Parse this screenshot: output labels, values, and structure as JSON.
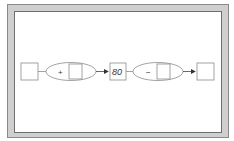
{
  "diagram": {
    "type": "number-machine-flow",
    "nodes": [
      {
        "id": "input-box",
        "kind": "box",
        "value": ""
      },
      {
        "id": "op1",
        "kind": "operator",
        "operator": "+",
        "operand": ""
      },
      {
        "id": "middle-box",
        "kind": "box",
        "value": "80"
      },
      {
        "id": "op2",
        "kind": "operator",
        "operator": "−",
        "operand": ""
      },
      {
        "id": "output-box",
        "kind": "box",
        "value": ""
      }
    ],
    "edges": [
      {
        "from": "input-box",
        "to": "op1",
        "arrow": false
      },
      {
        "from": "op1",
        "to": "middle-box",
        "arrow": true
      },
      {
        "from": "middle-box",
        "to": "op2",
        "arrow": false
      },
      {
        "from": "op2",
        "to": "output-box",
        "arrow": true
      }
    ]
  },
  "labels": {
    "op1_symbol": "+",
    "middle_value": "80",
    "op2_symbol": "−"
  },
  "colors": {
    "frame_fill": "#cfcfcf",
    "frame_border": "#8a8a8a",
    "stroke": "#8c8c8c",
    "arrow": "#333333"
  }
}
